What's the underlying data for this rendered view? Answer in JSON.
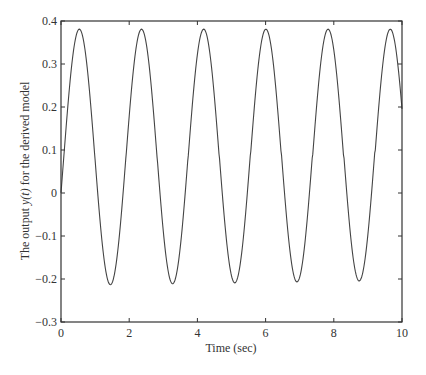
{
  "chart_data": {
    "type": "line",
    "title": "",
    "xlabel": "Time (sec)",
    "ylabel_parts": [
      "The output ",
      "y(t)",
      " for the derived model"
    ],
    "ylabel": "The output y(t) for the derived model",
    "xlim": [
      0,
      10
    ],
    "ylim": [
      -0.3,
      0.4
    ],
    "xticks": [
      0,
      2,
      4,
      6,
      8,
      10
    ],
    "xtick_labels": [
      "0",
      "2",
      "4",
      "6",
      "8",
      "10"
    ],
    "yticks": [
      -0.3,
      -0.2,
      -0.1,
      0,
      0.1,
      0.2,
      0.3,
      0.4
    ],
    "ytick_labels": [
      "−0.3",
      "−0.2",
      "−0.1",
      "0",
      "0.1",
      "0.2",
      "0.3",
      "0.4"
    ],
    "grid": false,
    "legend": null,
    "line_color": "#444444",
    "axis_color": "#333333",
    "series": [
      {
        "name": "y(t)",
        "model": {
          "offset": 0.083,
          "amplitude": 0.298,
          "omega": 3.445,
          "phase": -0.28
        },
        "peaks": [
          {
            "x": 0.53,
            "y": 0.381
          },
          {
            "x": 2.35,
            "y": 0.381
          },
          {
            "x": 4.17,
            "y": 0.381
          },
          {
            "x": 6.0,
            "y": 0.381
          },
          {
            "x": 7.82,
            "y": 0.381
          },
          {
            "x": 9.65,
            "y": 0.381
          }
        ],
        "troughs": [
          {
            "x": 1.44,
            "y": -0.216
          },
          {
            "x": 3.27,
            "y": -0.212
          },
          {
            "x": 5.09,
            "y": -0.21
          },
          {
            "x": 6.91,
            "y": -0.207
          },
          {
            "x": 8.73,
            "y": -0.205
          }
        ],
        "start": {
          "x": 0,
          "y": 0
        },
        "end": {
          "x": 10,
          "y": 0.19
        }
      }
    ]
  }
}
